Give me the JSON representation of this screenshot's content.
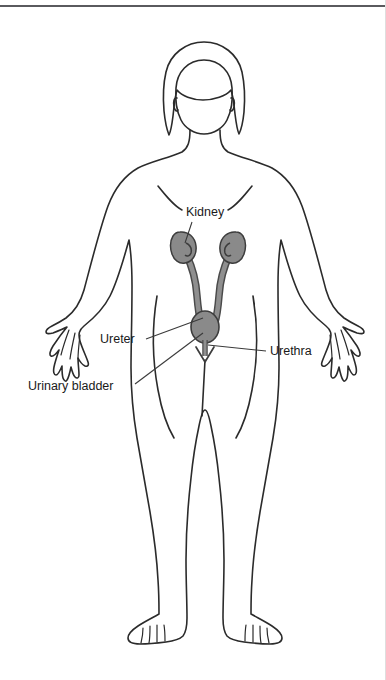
{
  "figure": {
    "title_visible": false,
    "background_color": "#ffffff",
    "outline_color": "#2b2b2b",
    "organ_fill_color": "#8a8a8a",
    "organ_outline_color": "#4a4a4a",
    "leader_line_color": "#3a3a3a",
    "label_color": "#1a1a1a"
  },
  "labels": [
    {
      "id": "kidney",
      "text": "Kidney",
      "x": 186,
      "y": 216,
      "anchor": "start",
      "leader": {
        "x1": 192,
        "y1": 222,
        "x2": 185,
        "y2": 243
      }
    },
    {
      "id": "ureter",
      "text": "Ureter",
      "x": 100,
      "y": 343,
      "anchor": "start",
      "leader": {
        "x1": 146,
        "y1": 339,
        "x2": 203,
        "y2": 318
      }
    },
    {
      "id": "urinary-bladder",
      "text": "Urinary bladder",
      "x": 28,
      "y": 390,
      "anchor": "start",
      "leader": {
        "x1": 135,
        "y1": 384,
        "x2": 203,
        "y2": 333
      }
    },
    {
      "id": "urethra",
      "text": "Urethra",
      "x": 270,
      "y": 355,
      "anchor": "start",
      "leader": {
        "x1": 266,
        "y1": 351,
        "x2": 208,
        "y2": 345
      }
    }
  ],
  "organs": {
    "kidney_left": {
      "cx": 184,
      "cy": 247,
      "rx": 12,
      "ry": 15
    },
    "kidney_right": {
      "cx": 232,
      "cy": 247,
      "rx": 12,
      "ry": 15
    },
    "bladder": {
      "cx": 205,
      "cy": 327,
      "rx": 14,
      "ry": 16
    },
    "urethra_tip_y": 360
  }
}
